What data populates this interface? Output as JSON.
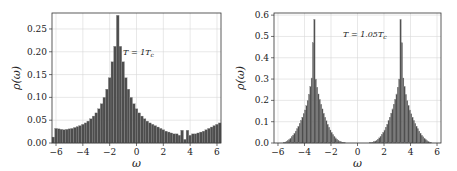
{
  "chart_data": [
    {
      "type": "bar",
      "title": "",
      "annotation": "T = 1T_c",
      "annotation_display": "T = 1T",
      "annotation_sub": "c",
      "xlabel": "ω",
      "ylabel": "ρ(ω)",
      "xlim": [
        -6.3,
        6.3
      ],
      "ylim": [
        0,
        0.285
      ],
      "xticks": [
        -6,
        -4,
        -2,
        0,
        2,
        4,
        6
      ],
      "xtick_labels": [
        "−6",
        "−4",
        "−2",
        "0",
        "2",
        "4",
        "6"
      ],
      "yticks": [
        0,
        0.05,
        0.1,
        0.15,
        0.2,
        0.25
      ],
      "ytick_labels": [
        "0.00",
        "0.05",
        "0.10",
        "0.15",
        "0.20",
        "0.25"
      ],
      "grid": true,
      "bin_width": 0.2,
      "bin_start": -6.3,
      "values": [
        0.013,
        0.032,
        0.031,
        0.03,
        0.029,
        0.03,
        0.031,
        0.032,
        0.034,
        0.036,
        0.038,
        0.041,
        0.044,
        0.048,
        0.053,
        0.059,
        0.066,
        0.075,
        0.086,
        0.1,
        0.118,
        0.143,
        0.178,
        0.212,
        0.28,
        0.212,
        0.178,
        0.143,
        0.118,
        0.1,
        0.086,
        0.075,
        0.066,
        0.059,
        0.053,
        0.048,
        0.044,
        0.041,
        0.038,
        0.035,
        0.032,
        0.029,
        0.026,
        0.024,
        0.022,
        0.02,
        0.02,
        0.017,
        0.028,
        0.008,
        0.028,
        0.017,
        0.02,
        0.02,
        0.022,
        0.024,
        0.026,
        0.029,
        0.032,
        0.035,
        0.038,
        0.041,
        0.044
      ]
    },
    {
      "type": "bar",
      "title": "",
      "annotation": "T = 1.05T_c",
      "annotation_display": "T = 1.05T",
      "annotation_sub": "c",
      "xlabel": "ω",
      "ylabel": "ρ(ω)",
      "xlim": [
        -6.3,
        6.3
      ],
      "ylim": [
        0,
        0.61
      ],
      "xticks": [
        -6,
        -4,
        -2,
        0,
        2,
        4,
        6
      ],
      "xtick_labels": [
        "−6",
        "−4",
        "−2",
        "0",
        "2",
        "4",
        "6"
      ],
      "yticks": [
        0,
        0.1,
        0.2,
        0.3,
        0.4,
        0.5,
        0.6
      ],
      "ytick_labels": [
        "0.0",
        "0.1",
        "0.2",
        "0.3",
        "0.4",
        "0.5",
        "0.6"
      ],
      "grid": true,
      "bin_width": 0.1,
      "bin_start": -5.6,
      "values": [
        0.002,
        0.004,
        0.007,
        0.011,
        0.016,
        0.022,
        0.029,
        0.037,
        0.046,
        0.056,
        0.067,
        0.079,
        0.092,
        0.106,
        0.121,
        0.137,
        0.155,
        0.175,
        0.198,
        0.228,
        0.265,
        0.305,
        0.47,
        0.58,
        0.3,
        0.262,
        0.23,
        0.205,
        0.182,
        0.16,
        0.14,
        0.121,
        0.104,
        0.088,
        0.074,
        0.061,
        0.05,
        0.04,
        0.031,
        0.024,
        0.018,
        0.013,
        0.009,
        0.006,
        0.004,
        0.002,
        0.001,
        0,
        0,
        0,
        0,
        0,
        0,
        0,
        0,
        0,
        0,
        0,
        0,
        0,
        0,
        0,
        0,
        0,
        0,
        0,
        0,
        0,
        0,
        0,
        0,
        0,
        0,
        0,
        0,
        0,
        0,
        0,
        0,
        0,
        0,
        0,
        0,
        0,
        0,
        0,
        0,
        0,
        0,
        0,
        0,
        0,
        0,
        0,
        0,
        0,
        0,
        0,
        0,
        0,
        0,
        0,
        0,
        0,
        0,
        0,
        0,
        0,
        0,
        0,
        0,
        0,
        0,
        0,
        0,
        0,
        0,
        0,
        0,
        0,
        0,
        0,
        0,
        0,
        0,
        0,
        0,
        0,
        0,
        0,
        0,
        0,
        0,
        0,
        0,
        0,
        0,
        0,
        0,
        0,
        0,
        0,
        0,
        0,
        0,
        0,
        0,
        0,
        0,
        0,
        0,
        0,
        0,
        0,
        0,
        0,
        0,
        0,
        0
      ]
    }
  ],
  "colors": {
    "bar": "#4d4d4d",
    "bar_edge": "#8a8a8a",
    "grid": "#d9d9d9",
    "axis": "#333333"
  }
}
